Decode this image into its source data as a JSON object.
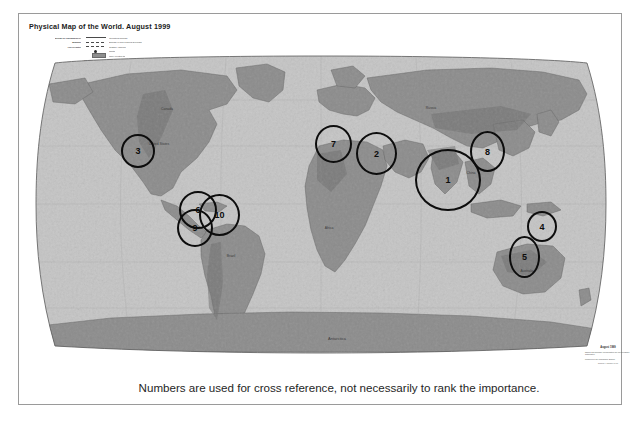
{
  "document": {
    "title": "Physical Map of the World. August 1999",
    "caption": "Numbers are used for cross reference, not necessarily to rank the importance."
  },
  "legend": {
    "rows": [
      {
        "key": "BOUNDARY REPRESENTATION IS NOT NECESSARILY AUTHORITATIVE",
        "swatch": "solid-line",
        "label": "International boundary"
      },
      {
        "key": "Boundary",
        "swatch": "dashed-line",
        "label": "Boundary or area of special sovereignty"
      },
      {
        "key": "Line of control",
        "swatch": "dash-dot-line",
        "label": "Coastline / shoreline"
      },
      {
        "key": "",
        "swatch": "dot-marker",
        "label": "Capital"
      },
      {
        "key": "",
        "swatch": "land-swatch",
        "label": "Land / elevation tint"
      }
    ],
    "note": "Scale 1:35,000,000 at the Equator\nRobinson Projection\nstandard parallels 38 N and 38 S"
  },
  "map": {
    "projection_label": "Robinson projection",
    "ocean_color": "#c6c6c6",
    "land_color": "#8c8c8c",
    "land_dark_color": "#6f6f6f",
    "outline_color": "#5a5a5a",
    "labels": [
      {
        "name": "Canada",
        "x": 148,
        "y": 96
      },
      {
        "name": "United States",
        "x": 140,
        "y": 131
      },
      {
        "name": "Brazil",
        "x": 212,
        "y": 243
      },
      {
        "name": "Russia",
        "x": 412,
        "y": 95
      },
      {
        "name": "China",
        "x": 452,
        "y": 160
      },
      {
        "name": "Africa",
        "x": 310,
        "y": 215
      },
      {
        "name": "Australia",
        "x": 508,
        "y": 258
      },
      {
        "name": "Antarctica",
        "x": 318,
        "y": 344
      }
    ]
  },
  "markers": [
    {
      "id": "1",
      "label": "1",
      "x": 415,
      "y": 149,
      "w": 62,
      "h": 58,
      "region": "south-china-sea"
    },
    {
      "id": "2",
      "label": "2",
      "x": 356,
      "y": 132,
      "w": 37,
      "h": 39,
      "region": "middle-east"
    },
    {
      "id": "3",
      "label": "3",
      "x": 121,
      "y": 134,
      "w": 30,
      "h": 30,
      "region": "western-united-states"
    },
    {
      "id": "4",
      "label": "4",
      "x": 527,
      "y": 211,
      "w": 26,
      "h": 27,
      "region": "papua-new-guinea"
    },
    {
      "id": "5",
      "label": "5",
      "x": 509,
      "y": 236,
      "w": 27,
      "h": 38,
      "region": "eastern-australia"
    },
    {
      "id": "6",
      "label": "6",
      "x": 179,
      "y": 191,
      "w": 34,
      "h": 34,
      "region": "northwestern-south-america"
    },
    {
      "id": "7",
      "label": "7",
      "x": 315,
      "y": 125,
      "w": 33,
      "h": 34,
      "region": "balkans-europe"
    },
    {
      "id": "8",
      "label": "8",
      "x": 470,
      "y": 131,
      "w": 31,
      "h": 37,
      "region": "korea-japan"
    },
    {
      "id": "9",
      "label": "9",
      "x": 177,
      "y": 209,
      "w": 32,
      "h": 34,
      "region": "peru-bolivia"
    },
    {
      "id": "10",
      "label": "10",
      "x": 199,
      "y": 194,
      "w": 37,
      "h": 38,
      "region": "amazon-basin"
    }
  ],
  "source_note": {
    "heading": "August 1999",
    "body": "Names and boundary representation are not necessarily authoritative.",
    "body2": "Produced by the Cartography Branch.",
    "footer": "803345AI (R00594) 8-99"
  }
}
